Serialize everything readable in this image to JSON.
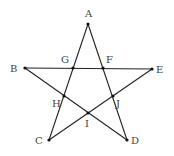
{
  "diagram": {
    "type": "pentagram",
    "points": {
      "A": {
        "label": "A",
        "x": 88,
        "y": 24,
        "lx": 85,
        "ly": 17
      },
      "B": {
        "label": "B",
        "x": 25,
        "y": 68,
        "lx": 10,
        "ly": 72
      },
      "C": {
        "label": "C",
        "x": 49,
        "y": 140,
        "lx": 35,
        "ly": 144
      },
      "D": {
        "label": "D",
        "x": 127,
        "y": 140,
        "lx": 131,
        "ly": 144
      },
      "E": {
        "label": "E",
        "x": 152,
        "y": 69,
        "lx": 156,
        "ly": 73
      },
      "F": {
        "label": "F",
        "x": 103,
        "y": 68,
        "lx": 106,
        "ly": 63
      },
      "G": {
        "label": "G",
        "x": 73,
        "y": 68,
        "lx": 61,
        "ly": 63
      },
      "H": {
        "label": "H",
        "x": 64,
        "y": 96,
        "lx": 52,
        "ly": 107
      },
      "I": {
        "label": "I",
        "x": 88,
        "y": 113,
        "lx": 85,
        "ly": 127
      },
      "J": {
        "label": "J",
        "x": 113,
        "y": 96,
        "lx": 116,
        "ly": 107
      }
    },
    "segments": [
      [
        "A",
        "C"
      ],
      [
        "A",
        "D"
      ],
      [
        "B",
        "E"
      ],
      [
        "B",
        "D"
      ],
      [
        "C",
        "E"
      ]
    ],
    "line_color": "#222222"
  }
}
